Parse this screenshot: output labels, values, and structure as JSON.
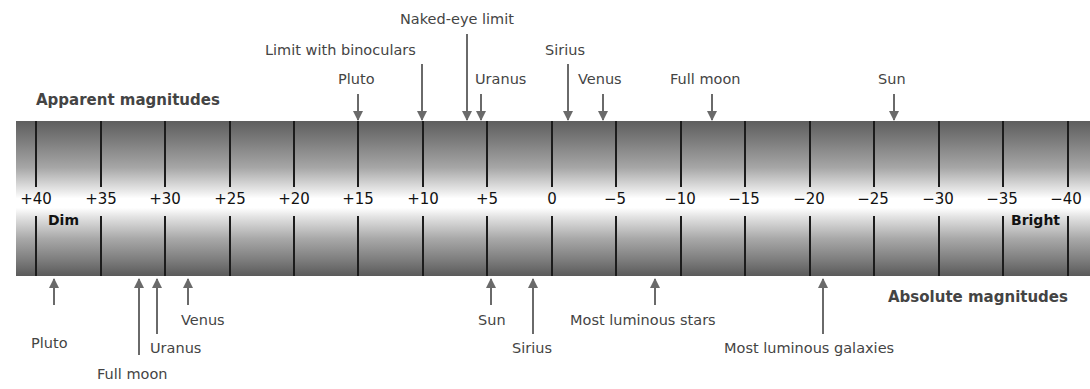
{
  "titles": {
    "apparent": "Apparent magnitudes",
    "absolute": "Absolute magnitudes"
  },
  "scale": {
    "ticks": [
      "+40",
      "+35",
      "+30",
      "+25",
      "+20",
      "+15",
      "+10",
      "+5",
      "0",
      "−5",
      "−10",
      "−15",
      "−20",
      "−25",
      "−30",
      "−35",
      "−40"
    ],
    "dim_label": "Dim",
    "bright_label": "Bright"
  },
  "apparent_markers": [
    {
      "label": "Pluto",
      "magnitude": 15
    },
    {
      "label": "Limit with binoculars",
      "magnitude": 10
    },
    {
      "label": "Naked-eye limit",
      "magnitude": 6.5
    },
    {
      "label": "Uranus",
      "magnitude": 5.5
    },
    {
      "label": "Sirius",
      "magnitude": -1.4
    },
    {
      "label": "Venus",
      "magnitude": -4.4
    },
    {
      "label": "Full moon",
      "magnitude": -12.6
    },
    {
      "label": "Sun",
      "magnitude": -26.7
    }
  ],
  "absolute_markers": [
    {
      "label": "Pluto",
      "magnitude": 38.5
    },
    {
      "label": "Full moon",
      "magnitude": 32
    },
    {
      "label": "Uranus",
      "magnitude": 30.5
    },
    {
      "label": "Venus",
      "magnitude": 28
    },
    {
      "label": "Sun",
      "magnitude": 4.8
    },
    {
      "label": "Sirius",
      "magnitude": 1.4
    },
    {
      "label": "Most luminous stars",
      "magnitude": -8
    },
    {
      "label": "Most luminous galaxies",
      "magnitude": -21
    }
  ]
}
